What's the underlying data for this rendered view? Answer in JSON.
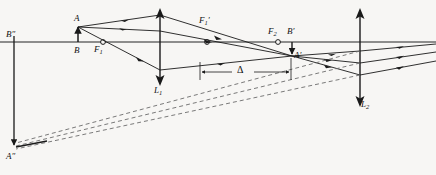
{
  "figure": {
    "type": "optical-ray-diagram",
    "width": 436,
    "height": 175,
    "background_color": "#f7f6f4",
    "line_color": "#1a1a1a",
    "axis_color": "#555555",
    "dashed_color": "#6b6b6b"
  },
  "labels": {
    "object_top": "A",
    "object_base": "B",
    "focus_first_lens_left": "F",
    "focus_first_lens_left_sub": "1",
    "focus_first_lens_right": "F",
    "focus_first_lens_right_sub": "1",
    "focus_first_lens_right_prime": "′",
    "focus_second_lens_left": "F",
    "focus_second_lens_left_sub": "2",
    "image_top": "A",
    "image_top_prime": "′",
    "image_base": "B",
    "image_base_prime": "′",
    "final_image_top": "A",
    "final_image_top_prime": "″",
    "final_image_base": "B",
    "final_image_base_prime": "″",
    "lens_one": "L",
    "lens_one_sub": "1",
    "lens_two": "L",
    "lens_two_sub": "2",
    "separation": "Δ"
  },
  "geometry": {
    "optical_axis_y": 42,
    "axis_x_start": 0,
    "axis_x_end": 436,
    "lens_one_x": 160,
    "lens_one_top_y": 10,
    "lens_one_bottom_y": 84,
    "lens_two_x": 360,
    "lens_two_top_y": 10,
    "lens_two_bottom_y": 106,
    "object_top_point": [
      78,
      26
    ],
    "object_base_point": [
      78,
      42
    ],
    "focus_one_left_point": [
      103,
      42
    ],
    "focus_one_right_point": [
      207,
      42
    ],
    "focus_two_left_point": [
      278,
      42
    ],
    "image_top_point": [
      292,
      56
    ],
    "image_base_point": [
      292,
      42
    ],
    "final_image_top_point": [
      14,
      147
    ],
    "final_image_base_point": [
      14,
      40
    ],
    "delta_dim_y": 72,
    "delta_dim_x_start": 200,
    "delta_dim_x_end": 291
  },
  "label_positions": {
    "A": [
      74,
      14
    ],
    "B": [
      74,
      47
    ],
    "F1": [
      94,
      44
    ],
    "F1prime": [
      200,
      16
    ],
    "F2": [
      268,
      27
    ],
    "Bprime": [
      288,
      27
    ],
    "Aprime": [
      293,
      52
    ],
    "Bdoubleprime": [
      6,
      31
    ],
    "Adoubleprime": [
      6,
      152
    ],
    "L1": [
      155,
      86
    ],
    "L2": [
      361,
      100
    ],
    "delta": [
      238,
      66
    ]
  }
}
